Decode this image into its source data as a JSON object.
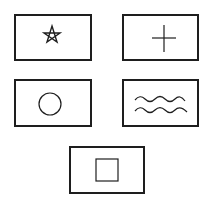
{
  "figure": {
    "cards": [
      {
        "symbol": "star"
      },
      {
        "symbol": "cross"
      },
      {
        "symbol": "circle"
      },
      {
        "symbol": "waves"
      },
      {
        "symbol": "square"
      }
    ]
  },
  "colors": {
    "stroke": "#1e1e1e",
    "background": "#ffffff"
  }
}
